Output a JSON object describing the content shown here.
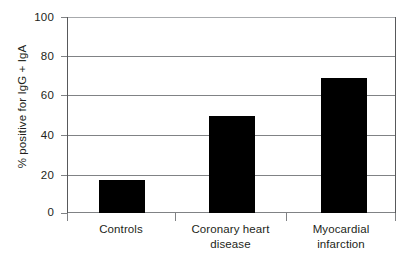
{
  "chart_data": {
    "type": "bar",
    "title": "",
    "subtitle": "",
    "xlabel": "",
    "ylabel": "% positive for IgG + IgA",
    "categories": [
      "Controls",
      "Coronary heart disease",
      "Myocardial infarction"
    ],
    "category_lines": [
      [
        "Controls"
      ],
      [
        "Coronary heart",
        "disease"
      ],
      [
        "Myocardial",
        "infarction"
      ]
    ],
    "values": [
      17,
      50,
      69
    ],
    "series": [
      {
        "name": "% positive for IgG + IgA",
        "values": [
          17,
          50,
          69
        ]
      }
    ],
    "ylim": [
      0,
      100
    ],
    "yticks": [
      0,
      20,
      40,
      60,
      80,
      100
    ],
    "ytick_labels": [
      "0",
      "20",
      "40",
      "60",
      "80",
      "100"
    ],
    "grid": true,
    "grid_axis": "y",
    "legend": false,
    "legend_position": "none",
    "bar_color": "#000000",
    "grid_color": "#808285",
    "axis_color": "#58595b",
    "text_color": "#231f20",
    "background": "#ffffff",
    "annotations": []
  }
}
